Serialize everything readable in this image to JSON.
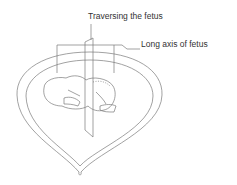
{
  "labels": {
    "traversing": "Traversing the fetus",
    "long_axis": "Long axis of fetus"
  },
  "colors": {
    "line": "#777777",
    "text": "#333333"
  }
}
